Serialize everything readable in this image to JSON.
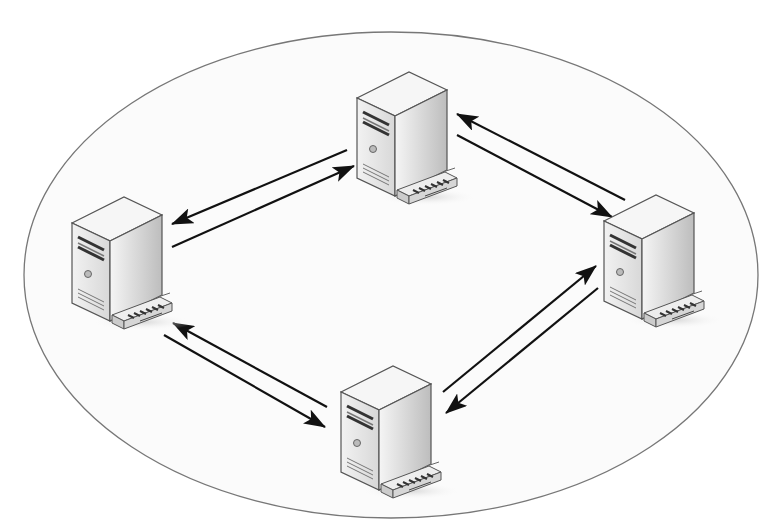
{
  "diagram": {
    "type": "peer-to-peer network",
    "boundary": {
      "shape": "ellipse",
      "cx": 391,
      "cy": 275,
      "rx": 367,
      "ry": 243,
      "stroke": "#777777",
      "fill": "#fbfbfb"
    },
    "nodes": [
      {
        "id": "top",
        "label": "",
        "icon": "server-tower-icon",
        "x": 357,
        "y": 72
      },
      {
        "id": "left",
        "label": "",
        "icon": "server-tower-icon",
        "x": 72,
        "y": 197
      },
      {
        "id": "right",
        "label": "",
        "icon": "server-tower-icon",
        "x": 604,
        "y": 195
      },
      {
        "id": "bottom",
        "label": "",
        "icon": "server-tower-icon",
        "x": 341,
        "y": 366
      }
    ],
    "connections": [
      {
        "from": "top",
        "to": "left",
        "x1": 347,
        "y1": 150,
        "x2": 172,
        "y2": 224
      },
      {
        "from": "left",
        "to": "top",
        "x1": 172,
        "y1": 247,
        "x2": 354,
        "y2": 166
      },
      {
        "from": "right",
        "to": "top",
        "x1": 625,
        "y1": 200,
        "x2": 457,
        "y2": 114
      },
      {
        "from": "top",
        "to": "right",
        "x1": 457,
        "y1": 135,
        "x2": 612,
        "y2": 217
      },
      {
        "from": "bottom",
        "to": "left",
        "x1": 327,
        "y1": 407,
        "x2": 173,
        "y2": 323
      },
      {
        "from": "left",
        "to": "bottom",
        "x1": 164,
        "y1": 335,
        "x2": 325,
        "y2": 427
      },
      {
        "from": "bottom",
        "to": "right",
        "x1": 443,
        "y1": 392,
        "x2": 596,
        "y2": 266
      },
      {
        "from": "right",
        "to": "bottom",
        "x1": 598,
        "y1": 288,
        "x2": 446,
        "y2": 413
      }
    ],
    "colors": {
      "arrow": "#111111",
      "server_front": "#e6e6e6",
      "server_side": "#c9c9c9",
      "server_top": "#f4f4f4",
      "outline": "#555555"
    }
  }
}
